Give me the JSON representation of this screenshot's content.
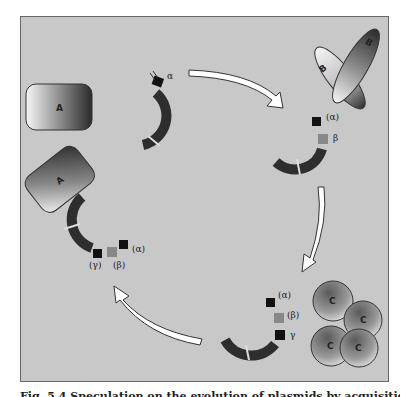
{
  "figure": {
    "caption": "Fig. 5.4 Speculation on the evolution of plasmids by acquisition of genes from the environment",
    "background": "#c8c8c8"
  },
  "proteins": {
    "A": "A",
    "B": "B",
    "C": "C"
  },
  "plasmid_stage1": {
    "genes": [
      "α"
    ]
  },
  "plasmid_stage2": {
    "genes": [
      "(α)",
      "β"
    ]
  },
  "plasmid_stage3": {
    "genes": [
      "(α)",
      "(β)",
      "γ"
    ]
  },
  "plasmid_stage4": {
    "genes": [
      "(α)",
      "(β)",
      "(γ)"
    ]
  },
  "arrows": [
    "stage1-to-stage2",
    "stage2-to-stage3",
    "stage3-to-stage4"
  ]
}
